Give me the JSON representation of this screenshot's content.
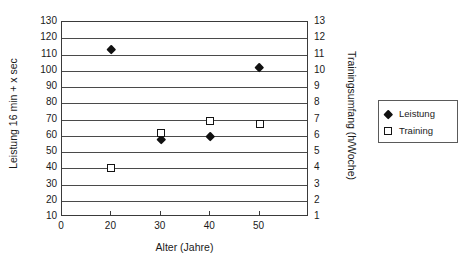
{
  "chart_data": {
    "type": "scatter",
    "title": "",
    "xlabel": "Alter (Jahre)",
    "ylabel": "Leistung 16 min + x sec",
    "ylabel_secondary": "Trainingsumfang (h/Woche)",
    "grid": true,
    "legend_position": "right",
    "x": [
      20,
      30,
      40,
      50
    ],
    "xlim": [
      10,
      60
    ],
    "xticks": [
      0,
      20,
      30,
      40,
      50
    ],
    "xtick_labels": [
      "0",
      "20",
      "30",
      "40",
      "50"
    ],
    "ylim": [
      10,
      130
    ],
    "yticks": [
      10,
      20,
      30,
      40,
      50,
      60,
      70,
      80,
      90,
      100,
      110,
      120,
      130
    ],
    "ytick_labels": [
      "10",
      "20",
      "30",
      "40",
      "50",
      "60",
      "70",
      "80",
      "90",
      "100",
      "110",
      "120",
      "130"
    ],
    "ylim_secondary": [
      1,
      13
    ],
    "yticks_secondary": [
      1,
      2,
      3,
      4,
      5,
      6,
      7,
      8,
      9,
      10,
      11,
      12,
      13
    ],
    "ytick_labels_secondary": [
      "1",
      "2",
      "3",
      "4",
      "5",
      "6",
      "7",
      "8",
      "9",
      "10",
      "11",
      "12",
      "13"
    ],
    "series": [
      {
        "name": "Leistung",
        "axis": "left",
        "marker": "filled-diamond",
        "color": "#111111",
        "points": [
          {
            "x": 20,
            "y": 113
          },
          {
            "x": 30,
            "y": 58
          },
          {
            "x": 40,
            "y": 60
          },
          {
            "x": 50,
            "y": 102
          }
        ]
      },
      {
        "name": "Training",
        "axis": "right",
        "marker": "open-square",
        "color": "#141414",
        "points": [
          {
            "x": 20,
            "y": 4.0
          },
          {
            "x": 30,
            "y": 6.2
          },
          {
            "x": 40,
            "y": 6.9
          },
          {
            "x": 50,
            "y": 6.7
          }
        ]
      }
    ]
  },
  "legend": {
    "entries": [
      {
        "label": "Leistung",
        "marker": "filled-diamond"
      },
      {
        "label": "Training",
        "marker": "open-square"
      }
    ]
  }
}
